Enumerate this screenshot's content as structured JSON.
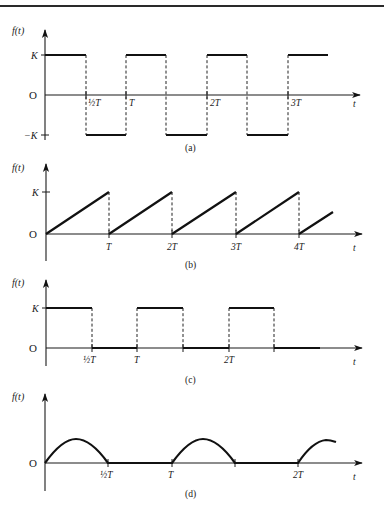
{
  "figure": {
    "panels": [
      {
        "id": "a",
        "caption": "(a)",
        "ylabel": "f(t)",
        "xlabel": "t",
        "y_ticks": [
          "K",
          "O",
          "−K"
        ],
        "x_ticks": [
          "½T",
          "T",
          "2T",
          "3T"
        ],
        "waveform": "square wave, ±K, 50% duty cycle"
      },
      {
        "id": "b",
        "caption": "(b)",
        "ylabel": "f(t)",
        "xlabel": "t",
        "y_ticks": [
          "K",
          "O"
        ],
        "x_ticks": [
          "T",
          "2T",
          "3T",
          "4T"
        ],
        "waveform": "sawtooth wave, 0 to K"
      },
      {
        "id": "c",
        "caption": "(c)",
        "ylabel": "f(t)",
        "xlabel": "t",
        "y_ticks": [
          "K",
          "O"
        ],
        "x_ticks": [
          "½T",
          "T",
          "2T"
        ],
        "waveform": "rectangular pulse train, 0 to K, 50% duty cycle"
      },
      {
        "id": "d",
        "caption": "(d)",
        "ylabel": "f(t)",
        "xlabel": "t",
        "y_ticks": [
          "O"
        ],
        "x_ticks": [
          "½T",
          "T",
          "2T"
        ],
        "waveform": "half-wave rectified sine"
      }
    ]
  }
}
